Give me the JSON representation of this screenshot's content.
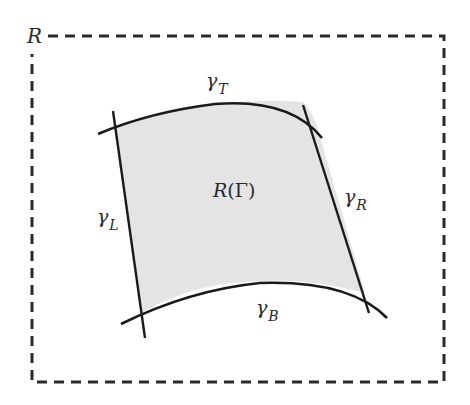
{
  "diagram": {
    "outer_region": {
      "label": "R",
      "style": "dashed",
      "stroke": "#2a2a2a"
    },
    "inner_region": {
      "label_main": "R",
      "label_open": "(",
      "label_symbol": "Γ",
      "label_close": ")",
      "fill": "#e4e4e4",
      "stroke": "#1a1a1a"
    },
    "curves": {
      "top": {
        "symbol": "γ",
        "subscript": "T"
      },
      "left": {
        "symbol": "γ",
        "subscript": "L"
      },
      "right": {
        "symbol": "γ",
        "subscript": "R"
      },
      "bottom": {
        "symbol": "γ",
        "subscript": "B"
      }
    }
  }
}
